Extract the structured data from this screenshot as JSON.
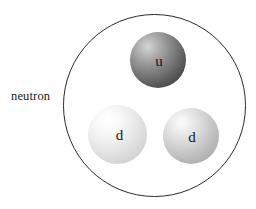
{
  "figure": {
    "name": "neutron-quark-composition-diagram",
    "background_color": "#ffffff",
    "label": "neutron",
    "boundary": {
      "name": "neutron-boundary",
      "shape": "circle",
      "stroke_color": "#2a2a2a",
      "fill": "none",
      "center_x": 155,
      "center_y": 106,
      "diameter": 183
    },
    "quarks": [
      {
        "id": "u",
        "letter": "u",
        "flavor": "up",
        "position": "top-center",
        "center_x": 158,
        "center_y": 60,
        "diameter": 56,
        "shade": "dark-gray",
        "base_color": "#3a3a3a",
        "highlight_color": "#d6d6d6"
      },
      {
        "id": "d-left",
        "letter": "d",
        "flavor": "down",
        "position": "bottom-left",
        "center_x": 117,
        "center_y": 134,
        "diameter": 59,
        "shade": "light-gray",
        "base_color": "#bdbdbd",
        "highlight_color": "#ffffff"
      },
      {
        "id": "d-right",
        "letter": "d",
        "flavor": "down",
        "position": "bottom-right",
        "center_x": 191,
        "center_y": 136,
        "diameter": 56,
        "shade": "medium-gray",
        "base_color": "#a1a1a1",
        "highlight_color": "#fdfdfd"
      }
    ]
  }
}
